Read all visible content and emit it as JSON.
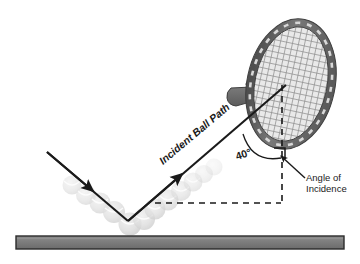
{
  "figure": {
    "background_color": "#ffffff"
  },
  "labels": {
    "incident_path": "Incident Ball Path",
    "angle_value": "40°",
    "angle_of_incidence_line1": "Angle of",
    "angle_of_incidence_line2": "Incidence"
  },
  "colors": {
    "line": "#1a1a1a",
    "ground_fill": "#7d7d7d",
    "ground_stroke": "#2b2b2b",
    "racket_frame": "#6e6e6e",
    "racket_frame_dark": "#4a4a4a",
    "racket_strings": "#9a9a9a",
    "ball_fill": "#cfcfcf",
    "text": "#1a1a1a"
  },
  "elements": {
    "ground_bar": "ground-surface",
    "racket": "tennis-racket",
    "incident_arrow": "incident-ball-path-arrow",
    "rebound_arrow": "rebound-ball-path-arrow",
    "angle_arc": "angle-arc",
    "normal_line": "normal-dashed-line",
    "horizontal_line": "horizontal-dashed-line",
    "right_angle_marker": "right-angle-marker",
    "leader_line": "angle-of-incidence-leader-arrow",
    "ball_trail": "ghost-ball-trail"
  },
  "geometry": {
    "bounce_point": [
      128,
      220
    ],
    "racket_contact_point": [
      285,
      85
    ],
    "normal_x": 282,
    "horizontal_y": 203,
    "angle_degrees": 40
  }
}
